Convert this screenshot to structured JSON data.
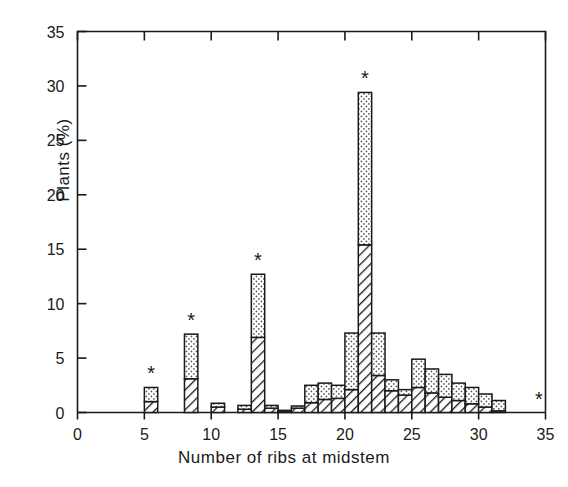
{
  "chart_data": {
    "type": "bar",
    "title": "",
    "xlabel": "Number of ribs at midstem",
    "ylabel": "Plants (%)",
    "xlim": [
      0,
      35
    ],
    "ylim": [
      0,
      35
    ],
    "xticks": [
      0,
      5,
      10,
      15,
      20,
      25,
      30,
      35
    ],
    "xtick_labels": [
      "0",
      "5",
      "10",
      "15",
      "20",
      "25",
      "30",
      "35"
    ],
    "yticks": [
      0,
      5,
      10,
      15,
      20,
      25,
      30,
      35
    ],
    "ytick_labels": [
      "0",
      "5",
      "10",
      "15",
      "20",
      "25",
      "30",
      "35"
    ],
    "grid": false,
    "legend": "none",
    "bin_width": 1,
    "categories": [
      4,
      5,
      6,
      7,
      8,
      9,
      10,
      11,
      12,
      13,
      14,
      15,
      16,
      17,
      18,
      19,
      20,
      21,
      22,
      23,
      24,
      25,
      26,
      27,
      28,
      29,
      30,
      31,
      32,
      33,
      34
    ],
    "series": [
      {
        "name": "hatched-lower",
        "fill": "diagonal-hatch",
        "values": [
          0,
          1.0,
          0,
          0,
          3.1,
          0,
          0.5,
          0,
          0.3,
          6.9,
          0.4,
          0.15,
          0.4,
          0.9,
          1.2,
          1.3,
          2.1,
          15.4,
          3.4,
          2.0,
          1.6,
          2.3,
          1.8,
          1.4,
          1.1,
          0.8,
          0.5,
          0.15,
          0,
          0,
          0
        ]
      },
      {
        "name": "dotted-upper",
        "fill": "stipple-dots",
        "values": [
          0,
          1.3,
          0,
          0,
          4.1,
          0,
          0.35,
          0,
          0.35,
          5.8,
          0.25,
          0.05,
          0.2,
          1.6,
          1.5,
          1.2,
          5.2,
          14.0,
          3.9,
          1.0,
          0.5,
          2.6,
          2.2,
          2.1,
          1.6,
          1.5,
          1.2,
          0.95,
          0,
          0,
          0
        ]
      }
    ],
    "totals": [
      0,
      2.3,
      0,
      0,
      7.2,
      0,
      0.85,
      0,
      0.65,
      12.7,
      0.65,
      0.2,
      0.6,
      2.5,
      2.7,
      2.5,
      7.3,
      29.4,
      7.3,
      3.0,
      2.1,
      4.9,
      4.0,
      3.5,
      2.7,
      2.3,
      1.7,
      1.1,
      0,
      0,
      0
    ],
    "annotations": [
      {
        "symbol": "*",
        "x": 5,
        "y": 2.3,
        "name": "asterisk-marker-5"
      },
      {
        "symbol": "*",
        "x": 8,
        "y": 7.2,
        "name": "asterisk-marker-8"
      },
      {
        "symbol": "*",
        "x": 13,
        "y": 12.7,
        "name": "asterisk-marker-13"
      },
      {
        "symbol": "*",
        "x": 21,
        "y": 29.4,
        "name": "asterisk-marker-21"
      },
      {
        "symbol": "*",
        "x": 34,
        "y": 0.0,
        "name": "asterisk-marker-34"
      }
    ],
    "colors": {
      "axis": "#1a1a1a",
      "bar_outline": "#1a1a1a",
      "hatch": "#1a1a1a",
      "dots": "#4a4a4a",
      "background": "#ffffff"
    }
  }
}
